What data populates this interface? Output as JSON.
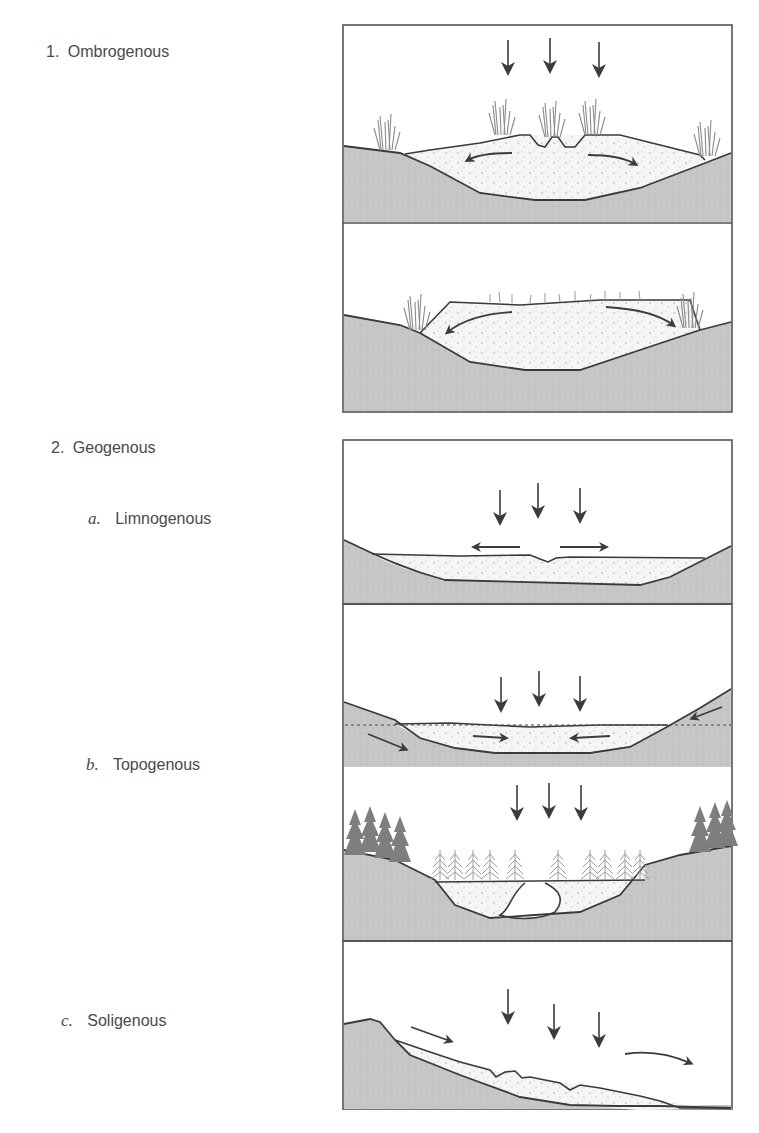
{
  "figure": {
    "labels": {
      "ombrogenous": {
        "index": "1.",
        "text": "Ombrogenous"
      },
      "geogenous": {
        "index": "2.",
        "text": "Geogenous"
      },
      "limnogenous": {
        "index": "a.",
        "text": "Limnogenous"
      },
      "topogenous": {
        "index": "b.",
        "text": "Topogenous"
      },
      "soligenous": {
        "index": "c.",
        "text": "Soligenous"
      }
    },
    "panels": [
      {
        "id": "ombrogenous-raised-bog",
        "group": "1. Ombrogenous",
        "arrows": "precipitation down, lateral outflow"
      },
      {
        "id": "ombrogenous-blanket",
        "group": "1. Ombrogenous",
        "arrows": "lateral outflow"
      },
      {
        "id": "limnogenous",
        "group": "2. Geogenous",
        "arrows": "precipitation down, lateral outflow"
      },
      {
        "id": "topogenous-groundwater",
        "group": "2. Geogenous",
        "arrows": "precipitation down, groundwater inflow"
      },
      {
        "id": "topogenous-forested",
        "group": "2. Geogenous",
        "arrows": "precipitation down"
      },
      {
        "id": "soligenous",
        "group": "2. Geogenous",
        "arrows": "precipitation down, downslope flow"
      }
    ],
    "colors": {
      "ground": "#c4c4c4",
      "peat": "#f4f4f4",
      "outline": "#3a3a3a",
      "vegetation": "#8f8f8f",
      "trees_dark": "#7d7d7d",
      "trees_light": "#a9a9a9",
      "arrow": "#3c3c3c"
    },
    "caption_partial": ""
  }
}
